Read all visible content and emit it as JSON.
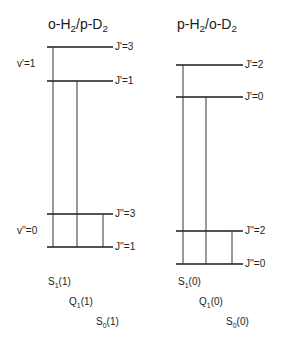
{
  "diagram": {
    "left_panel": {
      "title": "o-H2/p-D2",
      "title_parts": {
        "a": "o-H",
        "a_sub": "2",
        "b": "/p-D",
        "b_sub": "2"
      },
      "upper_vib_label": "v'=1",
      "lower_vib_label": "v''=0",
      "levels": [
        {
          "label": "J'=3",
          "y": 47
        },
        {
          "label": "J'=1",
          "y": 81
        },
        {
          "label": "J''=3",
          "y": 214
        },
        {
          "label": "J''=1",
          "y": 247
        }
      ],
      "transitions": [
        {
          "name": "S1(1)",
          "main": "S",
          "sub": "1",
          "arg": "(1)"
        },
        {
          "name": "Q1(1)",
          "main": "Q",
          "sub": "1",
          "arg": "(1)"
        },
        {
          "name": "S0(1)",
          "main": "S",
          "sub": "0",
          "arg": "(1)"
        }
      ]
    },
    "right_panel": {
      "title": "p-H2/o-D2",
      "title_parts": {
        "a": "p-H",
        "a_sub": "2",
        "b": "/o-D",
        "b_sub": "2"
      },
      "levels": [
        {
          "label": "J'=2",
          "y": 65
        },
        {
          "label": "J'=0",
          "y": 97
        },
        {
          "label": "J''=2",
          "y": 231
        },
        {
          "label": "J''=0",
          "y": 264
        }
      ],
      "transitions": [
        {
          "name": "S1(0)",
          "main": "S",
          "sub": "1",
          "arg": "(0)"
        },
        {
          "name": "Q1(0)",
          "main": "Q",
          "sub": "1",
          "arg": "(0)"
        },
        {
          "name": "S0(0)",
          "main": "S",
          "sub": "0",
          "arg": "(0)"
        }
      ]
    }
  }
}
